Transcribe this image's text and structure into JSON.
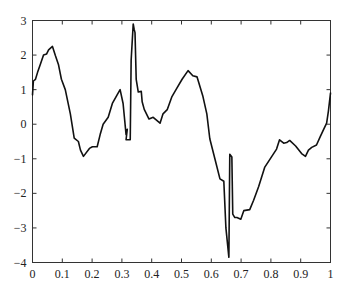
{
  "chart_data": {
    "type": "line",
    "title": "",
    "xlabel": "",
    "ylabel": "",
    "xlim": [
      0,
      1
    ],
    "ylim": [
      -4,
      3
    ],
    "grid": false,
    "legend": null,
    "x_ticks": [
      "0",
      "0.1",
      "0.2",
      "0.3",
      "0.4",
      "0.5",
      "0.6",
      "0.7",
      "0.8",
      "0.9",
      "1"
    ],
    "y_ticks": [
      "3",
      "2",
      "1",
      "0",
      "-1",
      "-2",
      "-3",
      "-4"
    ],
    "series": [
      {
        "name": "signal",
        "color": "#111111",
        "x": [
          0.0,
          0.003,
          0.01,
          0.017,
          0.027,
          0.037,
          0.047,
          0.054,
          0.067,
          0.077,
          0.087,
          0.097,
          0.11,
          0.127,
          0.14,
          0.154,
          0.161,
          0.171,
          0.191,
          0.201,
          0.217,
          0.227,
          0.237,
          0.254,
          0.268,
          0.284,
          0.294,
          0.304,
          0.314,
          0.318,
          0.314,
          0.328,
          0.331,
          0.338,
          0.341,
          0.344,
          0.348,
          0.355,
          0.365,
          0.368,
          0.375,
          0.391,
          0.405,
          0.428,
          0.438,
          0.452,
          0.468,
          0.485,
          0.502,
          0.522,
          0.538,
          0.552,
          0.572,
          0.585,
          0.595,
          0.612,
          0.629,
          0.642,
          0.649,
          0.659,
          0.662,
          0.669,
          0.672,
          0.679,
          0.686,
          0.699,
          0.709,
          0.729,
          0.742,
          0.759,
          0.779,
          0.819,
          0.829,
          0.843,
          0.853,
          0.863,
          0.883,
          0.903,
          0.916,
          0.926,
          0.937,
          0.953,
          0.966,
          0.977,
          0.987,
          0.993,
          1.0
        ],
        "values": [
          0.85,
          1.25,
          1.3,
          1.5,
          1.75,
          2.0,
          2.03,
          2.15,
          2.25,
          1.98,
          1.73,
          1.3,
          1.0,
          0.3,
          -0.4,
          -0.5,
          -0.75,
          -0.93,
          -0.7,
          -0.65,
          -0.65,
          -0.3,
          0.0,
          0.2,
          0.6,
          0.85,
          1.0,
          0.6,
          -0.3,
          -0.15,
          -0.45,
          -0.45,
          1.85,
          2.9,
          2.75,
          2.65,
          1.3,
          0.93,
          0.95,
          0.65,
          0.43,
          0.15,
          0.2,
          0.03,
          0.3,
          0.42,
          0.8,
          1.05,
          1.3,
          1.55,
          1.4,
          1.37,
          0.8,
          0.3,
          -0.42,
          -1.0,
          -1.58,
          -1.65,
          -3.0,
          -3.85,
          -0.87,
          -0.95,
          -2.6,
          -2.7,
          -2.7,
          -2.75,
          -2.5,
          -2.47,
          -2.2,
          -1.8,
          -1.25,
          -0.72,
          -0.45,
          -0.55,
          -0.53,
          -0.47,
          -0.63,
          -0.85,
          -0.93,
          -0.75,
          -0.67,
          -0.6,
          -0.35,
          -0.15,
          0.03,
          0.38,
          0.9
        ]
      }
    ]
  },
  "axes": {
    "x_tick_labels": [
      "0",
      "0.1",
      "0.2",
      "0.3",
      "0.4",
      "0.5",
      "0.6",
      "0.7",
      "0.8",
      "0.9",
      "1"
    ],
    "y_tick_labels": [
      "3",
      "2",
      "1",
      "0",
      "−1",
      "−2",
      "−3",
      "−4"
    ]
  }
}
